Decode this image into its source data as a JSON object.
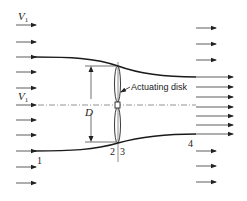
{
  "diagram": {
    "type": "actuating-disk-streamtube",
    "labels": {
      "v1_top": "V",
      "v1_top_sub": "1",
      "v1_mid": "V",
      "v1_mid_sub": "1",
      "diameter": "D",
      "disk": "Actuating disk",
      "station_1": "1",
      "station_2": "2",
      "station_3": "3",
      "station_4": "4"
    },
    "colors": {
      "line": "#222222",
      "background": "#ffffff"
    },
    "left_arrows_y": [
      25,
      42,
      57,
      72,
      88,
      105,
      120,
      135,
      151,
      167,
      183
    ],
    "right_short_arrows_y": [
      28,
      44,
      60,
      151,
      166,
      182
    ],
    "right_long_arrows_y": [
      77,
      87,
      97,
      107,
      116,
      125,
      134
    ]
  }
}
